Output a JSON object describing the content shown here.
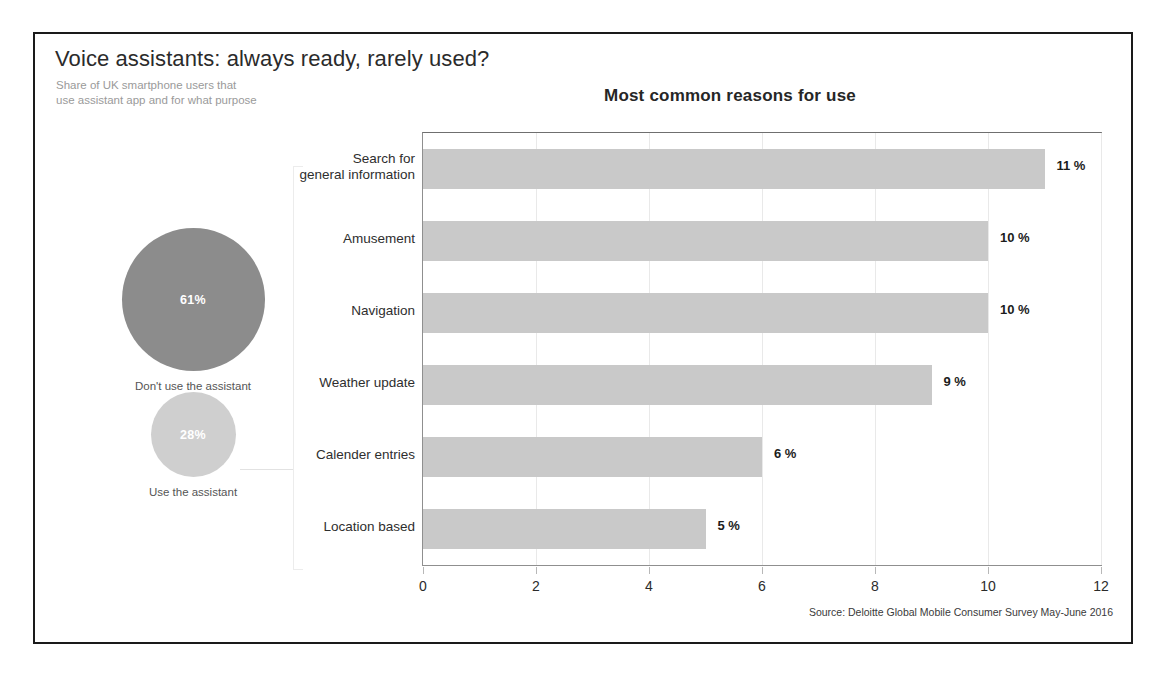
{
  "frame": {
    "border_color": "#1a1a1a"
  },
  "header": {
    "headline": "Voice assistants: always ready, rarely used?",
    "subhead": "Share of UK smartphone users that\nuse assistant app and for what purpose"
  },
  "circles": [
    {
      "name": "dont-use",
      "value": "61%",
      "caption": "Don't use the assistant",
      "color": "#8c8c8c"
    },
    {
      "name": "use",
      "value": "28%",
      "caption": "Use the assistant",
      "color": "#cfcfcf"
    }
  ],
  "source": "Source: Deloitte Global Mobile Consumer Survey May-June 2016",
  "chart_data": {
    "type": "bar",
    "orientation": "horizontal",
    "title": "Most common reasons for use",
    "xlabel": "",
    "ylabel": "",
    "xlim": [
      0,
      12
    ],
    "xticks": [
      "0",
      "2",
      "4",
      "6",
      "8",
      "10",
      "12"
    ],
    "xtick_values": [
      0,
      2,
      4,
      6,
      8,
      10,
      12
    ],
    "grid": true,
    "legend": "none",
    "bar_color": "#c9c9c9",
    "categories": [
      "Search for\ngeneral information",
      "Amusement",
      "Navigation",
      "Weather update",
      "Calender entries",
      "Location based"
    ],
    "values": [
      11,
      10,
      10,
      9,
      6,
      5
    ],
    "data_labels": [
      "11 %",
      "10 %",
      "10 %",
      "9 %",
      "6 %",
      "5 %"
    ]
  }
}
